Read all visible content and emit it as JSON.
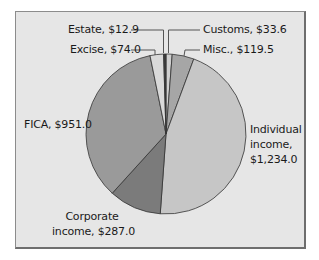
{
  "chart_data": {
    "type": "pie",
    "title": "",
    "unit": "$",
    "start_angle_deg": 0,
    "direction": "clockwise",
    "slices": [
      {
        "name": "Customs",
        "label": "Customs, $33.6",
        "value": 33.6,
        "color": "#cfcfcf"
      },
      {
        "name": "Misc.",
        "label": "Misc., $119.5",
        "value": 119.5,
        "color": "#a6a6a6"
      },
      {
        "name": "Individual income",
        "label": "Individual income, $1,234.0",
        "value": 1234.0,
        "color": "#c6c6c6"
      },
      {
        "name": "Corporate income",
        "label": "Corporate income, $287.0",
        "value": 287.0,
        "color": "#7b7b7b"
      },
      {
        "name": "FICA",
        "label": "FICA, $951.0",
        "value": 951.0,
        "color": "#9a9a9a"
      },
      {
        "name": "Excise",
        "label": "Excise, $74.0",
        "value": 74.0,
        "color": "#d9d9d9"
      },
      {
        "name": "Estate",
        "label": "Estate, $12.9",
        "value": 12.9,
        "color": "#3c3c3c"
      }
    ],
    "total": 2712.0,
    "legend": "none (direct labels)"
  },
  "labels": {
    "estate": "Estate, $12.9",
    "customs": "Customs, $33.6",
    "excise": "Excise, $74.0",
    "misc": "Misc., $119.5",
    "fica": "FICA, $951.0",
    "individual_line1": "Individual",
    "individual_line2": "income,",
    "individual_line3": "$1,234.0",
    "corporate_line1": "Corporate",
    "corporate_line2": "income, $287.0"
  },
  "colors": {
    "background": "#e6e6e6",
    "border": "#8c8c8c",
    "slice_stroke": "#333333",
    "leader": "#555555"
  }
}
